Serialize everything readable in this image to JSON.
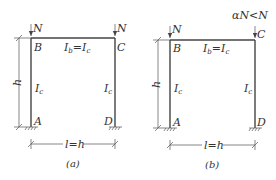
{
  "figures": [
    {
      "caption": "(a)",
      "loads": {
        "left": "N",
        "right": "N"
      },
      "nodes": {
        "top_left": "B",
        "top_right": "C",
        "bottom_left": "A",
        "bottom_right": "D"
      },
      "beam_label": {
        "lhs": "I",
        "lhs_sub": "b",
        "eq": "=",
        "rhs": "I",
        "rhs_sub": "c"
      },
      "left_column": {
        "main": "I",
        "sub": "c"
      },
      "right_column": {
        "main": "I",
        "sub": "c"
      },
      "height_dim": "h",
      "span_dim": "l=h"
    },
    {
      "caption": "(b)",
      "loads": {
        "left": "N",
        "right": "αN<N"
      },
      "nodes": {
        "top_left": "B",
        "top_right": "C",
        "bottom_left": "A",
        "bottom_right": "D"
      },
      "beam_label": {
        "lhs": "I",
        "lhs_sub": "b",
        "eq": "=",
        "rhs": "I",
        "rhs_sub": "c"
      },
      "left_column": {
        "main": "I",
        "sub": "c"
      },
      "right_column": {
        "main": "I",
        "sub": "c"
      },
      "height_dim": "h",
      "span_dim": "l=h"
    }
  ]
}
